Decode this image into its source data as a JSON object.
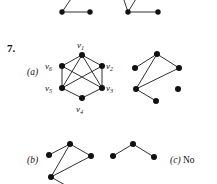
{
  "page": {
    "question_number": "7.",
    "part_a_label": "(a)",
    "part_b_label": "(b)",
    "part_c_label": "(c)",
    "part_c_answer": "No",
    "ink_color": "#111111"
  },
  "labels": {
    "v1": {
      "base": "v",
      "sub": "1"
    },
    "v2": {
      "base": "v",
      "sub": "2"
    },
    "v3": {
      "base": "v",
      "sub": "3"
    },
    "v4": {
      "base": "v",
      "sub": "4"
    },
    "v5": {
      "base": "v",
      "sub": "5"
    },
    "v6": {
      "base": "v",
      "sub": "6"
    }
  },
  "graphs": {
    "top_left_partial": {
      "name": "top-partial-graph-left",
      "nodes": [
        {
          "x": 62,
          "y": 12
        },
        {
          "x": 90,
          "y": 12
        }
      ],
      "edges": [
        {
          "x1": 62,
          "y1": 12,
          "x2": 90,
          "y2": 12
        },
        {
          "x1": 62,
          "y1": 12,
          "x2": 73,
          "y2": -4
        }
      ]
    },
    "top_right_partial": {
      "name": "top-partial-graph-right",
      "nodes": [
        {
          "x": 128,
          "y": 12
        },
        {
          "x": 158,
          "y": 12
        }
      ],
      "edges": [
        {
          "x1": 128,
          "y1": 12,
          "x2": 158,
          "y2": 12
        },
        {
          "x1": 128,
          "y1": 12,
          "x2": 122,
          "y2": -5
        },
        {
          "x1": 128,
          "y1": 12,
          "x2": 139,
          "y2": -5
        }
      ]
    },
    "a_left": {
      "name": "graph-a-left-labeled",
      "nodes": [
        {
          "id": "v1",
          "x": 82,
          "y": 55
        },
        {
          "id": "v2",
          "x": 102,
          "y": 66
        },
        {
          "id": "v3",
          "x": 102,
          "y": 88
        },
        {
          "id": "v4",
          "x": 82,
          "y": 98
        },
        {
          "id": "v5",
          "x": 62,
          "y": 88
        },
        {
          "id": "v6",
          "x": 62,
          "y": 66
        }
      ],
      "edges": [
        [
          "v1",
          "v6"
        ],
        [
          "v1",
          "v2"
        ],
        [
          "v1",
          "v5"
        ],
        [
          "v1",
          "v3"
        ],
        [
          "v6",
          "v5"
        ],
        [
          "v6",
          "v3"
        ],
        [
          "v2",
          "v3"
        ],
        [
          "v2",
          "v5"
        ],
        [
          "v5",
          "v4"
        ],
        [
          "v3",
          "v4"
        ]
      ]
    },
    "a_right": {
      "name": "graph-a-right",
      "nodes": [
        {
          "id": "p1",
          "x": 157,
          "y": 54
        },
        {
          "id": "p2",
          "x": 135,
          "y": 68
        },
        {
          "id": "p3",
          "x": 179,
          "y": 68
        },
        {
          "id": "p4",
          "x": 136,
          "y": 89
        },
        {
          "id": "p5",
          "x": 156,
          "y": 101
        },
        {
          "id": "p6",
          "x": 178,
          "y": 89
        }
      ],
      "edges": [
        [
          "p1",
          "p2"
        ],
        [
          "p1",
          "p3"
        ],
        [
          "p1",
          "p4"
        ],
        [
          "p3",
          "p4"
        ],
        [
          "p4",
          "p5"
        ]
      ]
    },
    "b_left": {
      "name": "graph-b-left",
      "nodes": [
        {
          "id": "q1",
          "x": 70,
          "y": 144
        },
        {
          "id": "q2",
          "x": 49,
          "y": 155
        },
        {
          "id": "q3",
          "x": 91,
          "y": 156
        },
        {
          "id": "q4",
          "x": 51,
          "y": 177
        },
        {
          "id": "q5",
          "x": 72,
          "y": 188
        }
      ],
      "edges": [
        [
          "q1",
          "q2"
        ],
        [
          "q1",
          "q3"
        ],
        [
          "q1",
          "q4"
        ],
        [
          "q3",
          "q4"
        ],
        [
          "q4",
          "q5"
        ]
      ]
    },
    "b_right": {
      "name": "graph-b-right",
      "nodes": [
        {
          "id": "r1",
          "x": 133,
          "y": 144
        },
        {
          "id": "r2",
          "x": 113,
          "y": 156
        },
        {
          "id": "r3",
          "x": 154,
          "y": 157
        }
      ],
      "edges": [
        [
          "r1",
          "r2"
        ],
        [
          "r1",
          "r3"
        ]
      ]
    }
  }
}
